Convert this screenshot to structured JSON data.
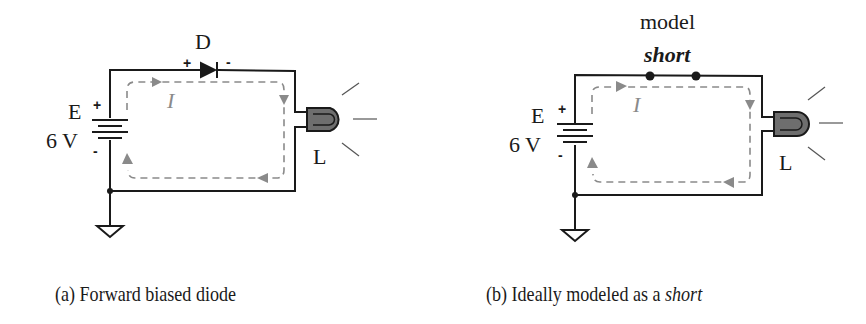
{
  "circuit_a": {
    "diode_label": "D",
    "diode_plus": "+",
    "diode_minus": "-",
    "source_label": "E",
    "source_value": "6 V",
    "source_plus": "+",
    "source_minus": "-",
    "current_label": "I",
    "lamp_label": "L",
    "caption": "(a) Forward biased diode"
  },
  "circuit_b": {
    "model_label": "model",
    "short_label": "short",
    "source_label": "E",
    "source_value": "6 V",
    "source_plus": "+",
    "source_minus": "-",
    "current_label": "I",
    "lamp_label": "L",
    "caption_prefix": "(b) Ideally modeled as a ",
    "caption_emph": "short"
  },
  "colors": {
    "wire": "#1a1a1a",
    "current_path": "#8a8a8a",
    "lamp_fill": "#6e6e6e"
  }
}
